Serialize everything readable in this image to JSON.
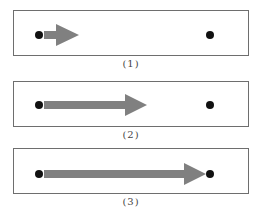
{
  "colors": {
    "arrow": "#808080",
    "dot": "#111111",
    "border": "#6e6e6e"
  },
  "panels": [
    {
      "caption": "(1)",
      "start_dot": {
        "x": 25,
        "y": 24
      },
      "end_dot": {
        "x": 196,
        "y": 24
      },
      "arrow": {
        "tail_x": 30,
        "head_start_x": 42,
        "tip_x": 65
      }
    },
    {
      "caption": "(2)",
      "start_dot": {
        "x": 25,
        "y": 23
      },
      "end_dot": {
        "x": 196,
        "y": 23
      },
      "arrow": {
        "tail_x": 30,
        "head_start_x": 111,
        "tip_x": 133
      }
    },
    {
      "caption": "(3)",
      "start_dot": {
        "x": 25,
        "y": 25
      },
      "end_dot": {
        "x": 196,
        "y": 25
      },
      "arrow": {
        "tail_x": 30,
        "head_start_x": 170,
        "tip_x": 192
      }
    }
  ]
}
